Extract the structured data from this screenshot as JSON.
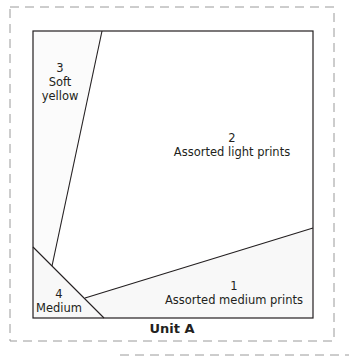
{
  "unit": {
    "title": "Unit A"
  },
  "pieces": [
    {
      "number": "3",
      "name_line1": "Soft",
      "name_line2": "yellow"
    },
    {
      "number": "2",
      "name": "Assorted light prints"
    },
    {
      "number": "1",
      "name": "Assorted medium prints"
    },
    {
      "number": "4",
      "name": "Medium"
    }
  ],
  "colors": {
    "line": "#231f20",
    "dashed": "#9a9a9a",
    "shaded_fill": "#f7f7f7"
  }
}
